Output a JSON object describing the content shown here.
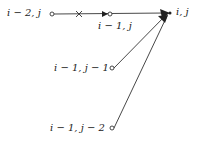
{
  "nodes": {
    "im2j": "i − 2, j",
    "im1j": "i − 1, j",
    "ij": "i, j",
    "im1jm1": "i − 1, j − 1",
    "im1jm2": "i − 1, j − 2"
  },
  "marker": "×"
}
